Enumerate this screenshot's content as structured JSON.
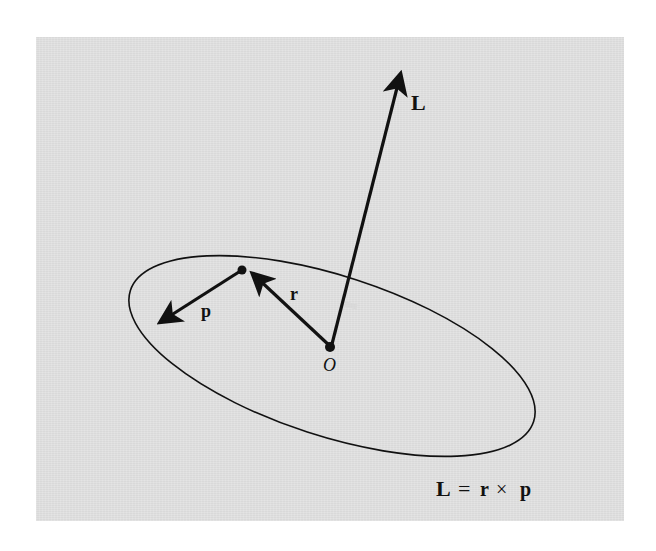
{
  "figure": {
    "background_color": "#d9d9d9",
    "ink_color": "#111111",
    "vectors": [
      {
        "name": "L",
        "label": "L",
        "from": "O",
        "direction": "up",
        "description": "angular momentum vector"
      },
      {
        "name": "r",
        "label": "r",
        "from": "O",
        "to": "particle",
        "description": "position vector"
      },
      {
        "name": "p",
        "label": "p",
        "from": "particle",
        "description": "linear momentum vector"
      }
    ],
    "points": {
      "origin_label": "O"
    },
    "orbit": {
      "shape": "ellipse"
    },
    "labels": {
      "L": "L",
      "r": "r",
      "p": "p",
      "O": "O"
    },
    "equation": {
      "lhs": "L",
      "equals": "=",
      "r": "r",
      "times": "×",
      "p": "p"
    }
  }
}
